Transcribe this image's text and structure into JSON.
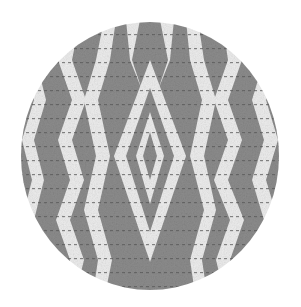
{
  "image": {
    "subject": "Circular woven fabric swatch with ikat-style diamond pattern",
    "shape": "circle",
    "center": [
      150,
      156
    ],
    "radius_x": 129,
    "radius_y": 134
  },
  "colors": {
    "background": "#ffffff",
    "dark": "#8c8c8c",
    "light": "#ededed",
    "stitch": "#5a5a5a"
  },
  "pattern": {
    "type": "diamond-zigzag",
    "center_motif": "nested diamonds",
    "stripe_count": 9
  }
}
